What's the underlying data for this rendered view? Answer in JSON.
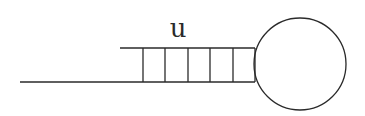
{
  "diagram": {
    "type": "hairpin-structure",
    "label": "u",
    "colors": {
      "line": "#2a2a2a",
      "background": "#ffffff"
    },
    "tail_strand": {
      "x1": 20,
      "x2": 143,
      "y": 82
    },
    "top_strand": {
      "x1": 120,
      "x2": 255,
      "y": 48
    },
    "bottom_strand": {
      "x1": 143,
      "x2": 255,
      "y": 82
    },
    "rungs_x": [
      143,
      165,
      188,
      210,
      233
    ],
    "stem_end_x": 255,
    "loop": {
      "cx": 300,
      "cy": 64,
      "r": 46
    }
  }
}
